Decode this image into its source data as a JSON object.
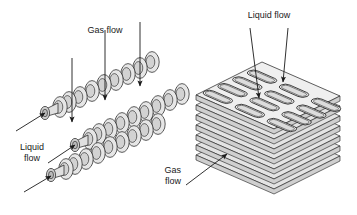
{
  "figure": {
    "kind": "technical-diagram",
    "background_color": "#ffffff",
    "line_color": "#1a1a1a",
    "fill_light": "#ececec",
    "fill_mid": "#dcdcdc",
    "fill_dark": "#c6c6c6",
    "text_color": "#1a1a1a"
  },
  "left_panel": {
    "name": "finned-tube-bundle",
    "tube_count": 3,
    "fins_per_tube": 9,
    "labels": {
      "gas_flow": "Gas flow",
      "liquid_flow_line1": "Liquid",
      "liquid_flow_line2": "flow"
    },
    "arrows": {
      "gas_flow_count": 3,
      "gas_flow_direction": "down",
      "liquid_flow_count": 3,
      "liquid_flow_direction": "up-right"
    }
  },
  "right_panel": {
    "name": "plate-fin-stack",
    "plate_count": 7,
    "channel_rows": 4,
    "channel_cols": 3,
    "channel_shape": "stadium",
    "labels": {
      "liquid_flow": "Liquid flow",
      "gas_flow_line1": "Gas",
      "gas_flow_line2": "flow"
    },
    "arrows": {
      "liquid_flow_count": 2,
      "liquid_flow_direction": "down",
      "gas_flow_count": 1,
      "gas_flow_direction": "up-right"
    }
  }
}
